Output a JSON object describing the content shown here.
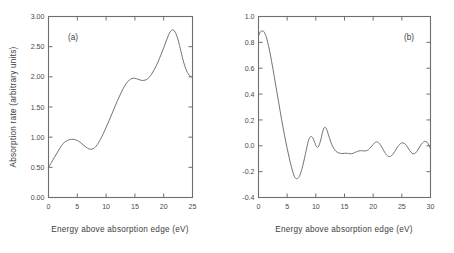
{
  "figure": {
    "background": "#ffffff",
    "curve_color": "#6a6a6a",
    "axis_color": "#6e6e6e",
    "text_color": "#3d3d3d"
  },
  "chart_data": [
    {
      "type": "line",
      "panel_label": "(a)",
      "title": "",
      "xlabel": "Energy above absorption edge (eV)",
      "ylabel": "Absorption rate (arbitrary units)",
      "xlim": [
        0,
        25
      ],
      "ylim": [
        0.0,
        3.0
      ],
      "xticks": [
        0,
        5,
        10,
        15,
        20,
        25
      ],
      "xticklabels": [
        "0",
        "5",
        "10",
        "15",
        "20",
        "25"
      ],
      "yticks": [
        0.0,
        0.5,
        1.0,
        1.5,
        2.0,
        2.5,
        3.0
      ],
      "yticklabels": [
        "0.00",
        "0.50",
        "1.00",
        "1.50",
        "2.00",
        "2.50",
        "3.00"
      ],
      "grid": false,
      "legend": "none",
      "series": [
        {
          "name": "absorption",
          "x": [
            0.0,
            0.5,
            1.0,
            1.5,
            2.0,
            2.5,
            3.0,
            3.5,
            4.0,
            4.5,
            5.0,
            5.5,
            6.0,
            6.5,
            7.0,
            7.5,
            8.0,
            8.5,
            9.0,
            9.5,
            10.0,
            10.5,
            11.0,
            11.5,
            12.0,
            12.5,
            13.0,
            13.5,
            14.0,
            14.5,
            15.0,
            15.5,
            16.0,
            16.5,
            17.0,
            17.5,
            18.0,
            18.5,
            19.0,
            19.5,
            20.0,
            20.5,
            21.0,
            21.5,
            22.0,
            22.5,
            23.0,
            23.5,
            24.0,
            24.5,
            25.0
          ],
          "y": [
            0.5,
            0.58,
            0.66,
            0.74,
            0.82,
            0.89,
            0.93,
            0.955,
            0.965,
            0.962,
            0.945,
            0.915,
            0.875,
            0.835,
            0.806,
            0.8,
            0.825,
            0.88,
            0.96,
            1.055,
            1.16,
            1.27,
            1.385,
            1.5,
            1.61,
            1.715,
            1.81,
            1.89,
            1.945,
            1.972,
            1.975,
            1.962,
            1.945,
            1.94,
            1.955,
            1.995,
            2.06,
            2.145,
            2.245,
            2.36,
            2.48,
            2.61,
            2.725,
            2.78,
            2.74,
            2.61,
            2.42,
            2.23,
            2.095,
            2.02,
            1.995
          ]
        }
      ]
    },
    {
      "type": "line",
      "panel_label": "(b)",
      "title": "",
      "xlabel": "Energy above absorption edge (eV)",
      "ylabel": "Dichroism (%)",
      "xlim": [
        0,
        30
      ],
      "ylim": [
        -0.4,
        1.0
      ],
      "xticks": [
        0,
        5,
        10,
        15,
        20,
        25,
        30
      ],
      "xticklabels": [
        "0",
        "5",
        "10",
        "15",
        "20",
        "25",
        "30"
      ],
      "yticks": [
        -0.4,
        -0.2,
        0.0,
        0.2,
        0.4,
        0.6,
        0.8,
        1.0
      ],
      "yticklabels": [
        "-0.4",
        "-0.2",
        "0.0",
        "0.2",
        "0.4",
        "0.6",
        "0.8",
        "1.0"
      ],
      "grid": false,
      "legend": "none",
      "series": [
        {
          "name": "dichroism",
          "x": [
            0.0,
            0.3,
            0.6,
            0.9,
            1.2,
            1.5,
            2.0,
            2.5,
            3.0,
            3.5,
            4.0,
            4.5,
            5.0,
            5.5,
            6.0,
            6.3,
            6.6,
            7.0,
            7.4,
            7.8,
            8.2,
            8.6,
            8.9,
            9.2,
            9.5,
            9.8,
            10.1,
            10.4,
            10.8,
            11.2,
            11.5,
            11.8,
            12.2,
            12.6,
            13.0,
            13.5,
            14.0,
            14.5,
            15.0,
            15.5,
            16.0,
            16.5,
            17.0,
            17.5,
            18.0,
            18.5,
            19.0,
            19.4,
            19.8,
            20.2,
            20.6,
            21.0,
            21.5,
            22.0,
            22.5,
            23.0,
            23.4,
            23.8,
            24.2,
            24.6,
            25.0,
            25.4,
            25.8,
            26.2,
            26.6,
            27.0,
            27.4,
            27.8,
            28.2,
            28.6,
            29.0,
            29.4,
            29.7,
            30.0
          ],
          "y": [
            0.85,
            0.88,
            0.888,
            0.885,
            0.86,
            0.82,
            0.72,
            0.6,
            0.47,
            0.34,
            0.21,
            0.09,
            -0.02,
            -0.12,
            -0.205,
            -0.24,
            -0.255,
            -0.245,
            -0.205,
            -0.14,
            -0.06,
            0.02,
            0.062,
            0.072,
            0.058,
            0.025,
            -0.005,
            -0.01,
            0.035,
            0.11,
            0.142,
            0.135,
            0.085,
            0.03,
            -0.01,
            -0.042,
            -0.055,
            -0.06,
            -0.058,
            -0.058,
            -0.062,
            -0.058,
            -0.048,
            -0.04,
            -0.038,
            -0.04,
            -0.035,
            -0.02,
            0.0,
            0.02,
            0.03,
            0.022,
            -0.01,
            -0.05,
            -0.078,
            -0.082,
            -0.068,
            -0.042,
            -0.012,
            0.01,
            0.022,
            0.02,
            0.002,
            -0.025,
            -0.05,
            -0.062,
            -0.055,
            -0.032,
            -0.002,
            0.022,
            0.035,
            0.028,
            0.005,
            -0.02
          ]
        }
      ]
    }
  ]
}
